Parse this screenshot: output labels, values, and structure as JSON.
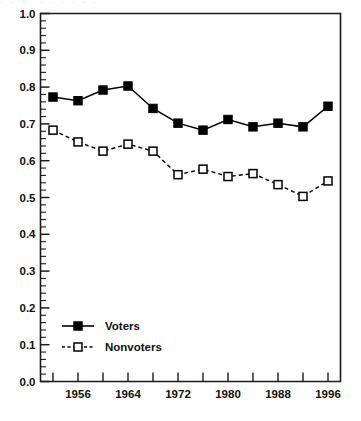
{
  "top_strip_text": "· · · · · · · · · ·",
  "chart_data": {
    "type": "line",
    "title": "",
    "subtitle": "",
    "xlabel": "",
    "ylabel": "",
    "x": [
      1952,
      1956,
      1960,
      1964,
      1968,
      1972,
      1976,
      1980,
      1984,
      1988,
      1992,
      1996
    ],
    "xlim": [
      1950,
      1998
    ],
    "ylim": [
      0.0,
      1.0
    ],
    "grid": false,
    "legend_position": "lower-left",
    "y_tick_labels": [
      "0.0",
      "0.1",
      "0.2",
      "0.3",
      "0.4",
      "0.5",
      "0.6",
      "0.7",
      "0.8",
      "0.9",
      "1.0"
    ],
    "y_tick_values": [
      0.0,
      0.1,
      0.2,
      0.3,
      0.4,
      0.5,
      0.6,
      0.7,
      0.8,
      0.9,
      1.0
    ],
    "y_minor_ticks_per_interval": 5,
    "x_tick_values": [
      1952,
      1956,
      1960,
      1964,
      1968,
      1972,
      1976,
      1980,
      1984,
      1988,
      1992,
      1996
    ],
    "x_tick_labels": [
      "",
      "1956",
      "",
      "1964",
      "",
      "1972",
      "",
      "1980",
      "",
      "1988",
      "",
      "1996"
    ],
    "x_labeled_values": [
      1956,
      1964,
      1972,
      1980,
      1988,
      1996
    ],
    "series": [
      {
        "name": "Voters",
        "marker": "filled-square",
        "line_style": "solid",
        "color": "#000000",
        "values": [
          0.773,
          0.763,
          0.792,
          0.803,
          0.742,
          0.702,
          0.683,
          0.712,
          0.692,
          0.702,
          0.692,
          0.748
        ]
      },
      {
        "name": "Nonvoters",
        "marker": "open-square",
        "line_style": "dashed",
        "color": "#000000",
        "values": [
          0.683,
          0.651,
          0.626,
          0.645,
          0.626,
          0.562,
          0.577,
          0.557,
          0.565,
          0.535,
          0.503,
          0.545
        ]
      }
    ]
  },
  "legend": {
    "items": [
      {
        "label": "Voters",
        "style": "solid-filled-square"
      },
      {
        "label": "Nonvoters",
        "style": "dashed-open-square"
      }
    ]
  },
  "colors": {
    "axis": "#1a1a1a",
    "series": "#000000",
    "background": "#ffffff",
    "text": "#111111"
  }
}
